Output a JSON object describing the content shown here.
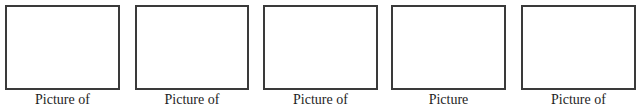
{
  "worksheet": {
    "frames": [
      {
        "caption": "Picture of"
      },
      {
        "caption": "Picture of"
      },
      {
        "caption": "Picture of"
      },
      {
        "caption": "Picture"
      },
      {
        "caption": "Picture of"
      }
    ]
  }
}
